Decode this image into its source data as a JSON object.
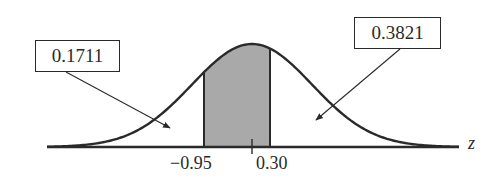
{
  "figure": {
    "type": "normal-distribution-shaded-area",
    "axis_label": "z",
    "tick_labels": {
      "left": "−0.95",
      "right": "0.30"
    },
    "callouts": {
      "left_tail": "0.1711",
      "right_tail": "0.3821"
    },
    "colors": {
      "curve": "#2a2a2a",
      "shade": "#a9a9a9",
      "background": "#ffffff"
    }
  },
  "chart_data": {
    "type": "area",
    "title": "",
    "xlabel": "z",
    "ylabel": "",
    "distribution": "standard normal",
    "shaded_interval": [
      -0.95,
      0.3
    ],
    "tick_labels": [
      "-0.95",
      "0.30"
    ],
    "annotations": [
      {
        "text": "0.1711",
        "points_to": "area left of z = -0.95"
      },
      {
        "text": "0.3821",
        "points_to": "area right of z = 0.30"
      }
    ],
    "grid": false,
    "legend": "none"
  }
}
